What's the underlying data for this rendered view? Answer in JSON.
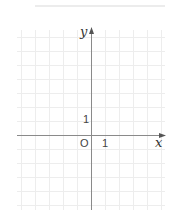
{
  "diagram": {
    "type": "coordinate-plane",
    "x_axis_label": "x",
    "y_axis_label": "y",
    "origin_label": "O",
    "x_unit_label": "1",
    "y_unit_label": "1",
    "unit_px": 14,
    "origin_px": [
      91,
      135
    ],
    "grid": {
      "x_min": -5,
      "x_max": 5,
      "y_min": -5,
      "y_max": 7
    },
    "colors": {
      "grid": "#ededed",
      "axis": "#8a8a8a",
      "text": "#333333"
    }
  }
}
